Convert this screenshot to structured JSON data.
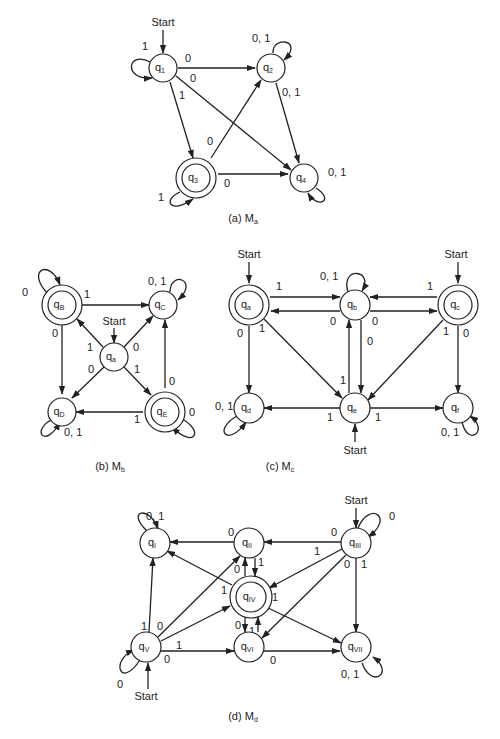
{
  "figures": [
    {
      "id": "Ma",
      "caption": "(a) M",
      "caption_sub": "a",
      "caption_pos": [
        243,
        218
      ],
      "states": [
        {
          "id": "q1",
          "label": "q",
          "sub": "1",
          "x": 163,
          "y": 68,
          "accept": false
        },
        {
          "id": "q2",
          "label": "q",
          "sub": "2",
          "x": 271,
          "y": 68,
          "accept": false
        },
        {
          "id": "q3",
          "label": "q",
          "sub": "3",
          "x": 196,
          "y": 178,
          "accept": true
        },
        {
          "id": "q4",
          "label": "q",
          "sub": "4",
          "x": 304,
          "y": 178,
          "accept": false
        }
      ],
      "start": [
        {
          "state": "q1",
          "dir": "top",
          "text": "Start"
        }
      ],
      "edges": [
        {
          "from": "q1",
          "to": "q1",
          "label": "1",
          "loop": "left"
        },
        {
          "from": "q1",
          "to": "q2",
          "label": "0"
        },
        {
          "from": "q1",
          "to": "q4",
          "label": "0"
        },
        {
          "from": "q1",
          "to": "q3",
          "label": "1"
        },
        {
          "from": "q2",
          "to": "q2",
          "label": "0, 1",
          "loop": "topright"
        },
        {
          "from": "q2",
          "to": "q4",
          "label": "0, 1"
        },
        {
          "from": "q3",
          "to": "q2",
          "label": "0"
        },
        {
          "from": "q3",
          "to": "q4",
          "label": "0"
        },
        {
          "from": "q3",
          "to": "q3",
          "label": "1",
          "loop": "bottomleft"
        },
        {
          "from": "q4",
          "to": "q4",
          "label": "0, 1",
          "loop": "bottomright"
        }
      ]
    },
    {
      "id": "Mb",
      "caption": "(b) M",
      "caption_sub": "b",
      "caption_pos": [
        104,
        465
      ],
      "states": [
        {
          "id": "qB",
          "label": "q",
          "sub": "B",
          "x": 62,
          "y": 305,
          "accept": true
        },
        {
          "id": "qC",
          "label": "q",
          "sub": "C",
          "x": 163,
          "y": 305,
          "accept": false
        },
        {
          "id": "qa",
          "label": "q",
          "sub": "a",
          "x": 114,
          "y": 357,
          "accept": false
        },
        {
          "id": "qD",
          "label": "q",
          "sub": "D",
          "x": 62,
          "y": 408,
          "accept": false
        },
        {
          "id": "qE",
          "label": "q",
          "sub": "E",
          "x": 163,
          "y": 408,
          "accept": true
        }
      ],
      "start": [
        {
          "state": "qa",
          "dir": "top",
          "text": "Start"
        }
      ],
      "edges": [
        {
          "from": "qB",
          "to": "qB",
          "label": "0",
          "loop": "topleft"
        },
        {
          "from": "qB",
          "to": "qC",
          "label": "1"
        },
        {
          "from": "qB",
          "to": "qD",
          "label": "0"
        },
        {
          "from": "qC",
          "to": "qC",
          "label": "0, 1",
          "loop": "topright"
        },
        {
          "from": "qa",
          "to": "qB",
          "label": "1"
        },
        {
          "from": "qa",
          "to": "qC",
          "label": "0"
        },
        {
          "from": "qa",
          "to": "qD",
          "label": "0"
        },
        {
          "from": "qa",
          "to": "qE",
          "label": "1"
        },
        {
          "from": "qE",
          "to": "qC",
          "label": "0"
        },
        {
          "from": "qE",
          "to": "qD",
          "label": "1"
        },
        {
          "from": "qE",
          "to": "qE",
          "label": "0",
          "loop": "bottomright"
        },
        {
          "from": "qD",
          "to": "qD",
          "label": "0, 1",
          "loop": "bottomleft"
        }
      ]
    },
    {
      "id": "Mc",
      "caption": "(c) M",
      "caption_sub": "c",
      "caption_pos": [
        274,
        465
      ],
      "states": [
        {
          "id": "qa",
          "label": "q",
          "sub": "a",
          "x": 249,
          "y": 305,
          "accept": true
        },
        {
          "id": "qb",
          "label": "q",
          "sub": "b",
          "x": 355,
          "y": 305,
          "accept": false
        },
        {
          "id": "qc",
          "label": "q",
          "sub": "c",
          "x": 458,
          "y": 305,
          "accept": true
        },
        {
          "id": "qd",
          "label": "q",
          "sub": "d",
          "x": 249,
          "y": 408,
          "accept": false
        },
        {
          "id": "qe",
          "label": "q",
          "sub": "e",
          "x": 355,
          "y": 408,
          "accept": false
        },
        {
          "id": "qf",
          "label": "q",
          "sub": "f",
          "x": 458,
          "y": 408,
          "accept": false
        }
      ],
      "start": [
        {
          "state": "qa",
          "dir": "top",
          "text": "Start"
        },
        {
          "state": "qc",
          "dir": "top",
          "text": "Start"
        },
        {
          "state": "qe",
          "dir": "bottom",
          "text": "Start"
        }
      ],
      "edges": [
        {
          "from": "qa",
          "to": "qb",
          "label": "1"
        },
        {
          "from": "qb",
          "to": "qa",
          "label": "0"
        },
        {
          "from": "qb",
          "to": "qc",
          "label": "0"
        },
        {
          "from": "qc",
          "to": "qb",
          "label": "1"
        },
        {
          "from": "qb",
          "to": "qb",
          "label": "0, 1",
          "loop": "top"
        },
        {
          "from": "qa",
          "to": "qd",
          "label": "0"
        },
        {
          "from": "qa",
          "to": "qe",
          "label": "1"
        },
        {
          "from": "qb",
          "to": "qe",
          "label": "0"
        },
        {
          "from": "qe",
          "to": "qb",
          "label": "1"
        },
        {
          "from": "qc",
          "to": "qe",
          "label": "1"
        },
        {
          "from": "qc",
          "to": "qf",
          "label": "0"
        },
        {
          "from": "qe",
          "to": "qd",
          "label": "1"
        },
        {
          "from": "qe",
          "to": "qf",
          "label": "1"
        },
        {
          "from": "qd",
          "to": "qd",
          "label": "0, 1",
          "loop": "bottomleft"
        },
        {
          "from": "qf",
          "to": "qf",
          "label": "0, 1",
          "loop": "bottomright"
        }
      ]
    },
    {
      "id": "Md",
      "caption": "(d) M",
      "caption_sub": "d",
      "caption_pos": [
        243,
        717
      ],
      "states": [
        {
          "id": "qI",
          "label": "q",
          "sub": "I",
          "x": 155,
          "y": 543,
          "accept": false
        },
        {
          "id": "qII",
          "label": "q",
          "sub": "II",
          "x": 249,
          "y": 543,
          "accept": false
        },
        {
          "id": "qIII",
          "label": "q",
          "sub": "III",
          "x": 356,
          "y": 543,
          "accept": false
        },
        {
          "id": "qIV",
          "label": "q",
          "sub": "IV",
          "x": 249,
          "y": 597,
          "accept": true
        },
        {
          "id": "qV",
          "label": "q",
          "sub": "V",
          "x": 146,
          "y": 647,
          "accept": false
        },
        {
          "id": "qVI",
          "label": "q",
          "sub": "VI",
          "x": 249,
          "y": 647,
          "accept": false
        },
        {
          "id": "qVII",
          "label": "q",
          "sub": "VII",
          "x": 356,
          "y": 647,
          "accept": false
        }
      ],
      "start": [
        {
          "state": "qIII",
          "dir": "top",
          "text": "Start"
        },
        {
          "state": "qV",
          "dir": "bottom",
          "text": "Start"
        }
      ],
      "edges": [
        {
          "from": "qI",
          "to": "qI",
          "label": "0, 1",
          "loop": "topleft"
        },
        {
          "from": "qII",
          "to": "qI",
          "label": "0"
        },
        {
          "from": "qIII",
          "to": "qII",
          "label": "0"
        },
        {
          "from": "qIII",
          "to": "qIII",
          "label": "0",
          "loop": "topright"
        },
        {
          "from": "qIII",
          "to": "qIV",
          "label": "1"
        },
        {
          "from": "qIII",
          "to": "qVI",
          "label": "0"
        },
        {
          "from": "qIII",
          "to": "qVII",
          "label": "1"
        },
        {
          "from": "qII",
          "to": "qIV",
          "label": "1"
        },
        {
          "from": "qIV",
          "to": "qII",
          "label": "0"
        },
        {
          "from": "qIV",
          "to": "qI",
          "label": "1"
        },
        {
          "from": "qIV",
          "to": "qVII",
          "label": "1"
        },
        {
          "from": "qIV",
          "to": "qVI",
          "label": "0"
        },
        {
          "from": "qVI",
          "to": "qIV",
          "label": "1"
        },
        {
          "from": "qV",
          "to": "qI",
          "label": "1"
        },
        {
          "from": "qV",
          "to": "qII",
          "label": "0"
        },
        {
          "from": "qV",
          "to": "qIV",
          "label": "1"
        },
        {
          "from": "qV",
          "to": "qVI",
          "label": "0"
        },
        {
          "from": "qV",
          "to": "qV",
          "label": "0",
          "loop": "bottomleft"
        },
        {
          "from": "qVI",
          "to": "qVII",
          "label": "0"
        },
        {
          "from": "qVII",
          "to": "qVII",
          "label": "0, 1",
          "loop": "bottomright"
        }
      ]
    }
  ]
}
